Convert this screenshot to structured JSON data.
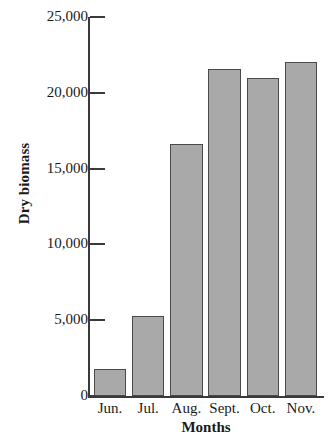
{
  "chart_data": {
    "type": "bar",
    "title": "",
    "xlabel": "Months",
    "ylabel": "Dry biomass",
    "categories": [
      "Jun.",
      "Jul.",
      "Aug.",
      "Sept.",
      "Oct.",
      "Nov."
    ],
    "values": [
      1800,
      5300,
      16600,
      21600,
      21000,
      22000
    ],
    "ylim": [
      0,
      25000
    ],
    "ytick_values": [
      0,
      5000,
      10000,
      15000,
      20000,
      25000
    ],
    "ytick_labels": [
      "0",
      "5,000",
      "10,000",
      "15,000",
      "20,000",
      "25,000"
    ],
    "grid": false,
    "legend": null,
    "bar_color": "#a9a9a9",
    "bar_edge_color": "#4a4a4a",
    "axis_color": "#3a3a3a"
  },
  "axes": {
    "y_title": "Dry biomass",
    "x_title": "Months"
  }
}
